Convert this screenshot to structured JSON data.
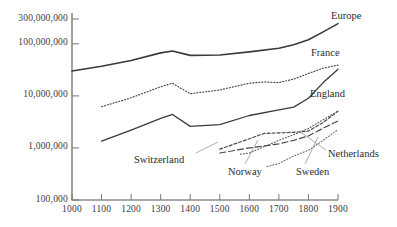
{
  "chart_data": {
    "type": "line",
    "title": "",
    "subtitle": "",
    "xlabel": "",
    "ylabel": "",
    "yscale": "log",
    "xlim": [
      1000,
      1900
    ],
    "ylim": [
      100000,
      300000000
    ],
    "grid": false,
    "legend_position": "inline-annotations",
    "y_ticks": [
      {
        "value": 300000000,
        "label": "300,000,000"
      },
      {
        "value": 100000000,
        "label": "100,000,000"
      },
      {
        "value": 10000000,
        "label": "10,000,000"
      },
      {
        "value": 1000000,
        "label": "1,000,000"
      },
      {
        "value": 100000,
        "label": "100,000"
      }
    ],
    "x_ticks": [
      {
        "value": 1000,
        "label": "1000"
      },
      {
        "value": 1100,
        "label": "1100"
      },
      {
        "value": 1200,
        "label": "1200"
      },
      {
        "value": 1300,
        "label": "1300"
      },
      {
        "value": 1400,
        "label": "1400"
      },
      {
        "value": 1500,
        "label": "1500"
      },
      {
        "value": 1600,
        "label": "1600"
      },
      {
        "value": 1700,
        "label": "1700"
      },
      {
        "value": 1800,
        "label": "1800"
      },
      {
        "value": 1900,
        "label": "1900"
      }
    ],
    "series": [
      {
        "name": "Europe",
        "style": "solid",
        "width": 1.6,
        "color": "#3a3a3a",
        "x": [
          1000,
          1100,
          1200,
          1300,
          1340,
          1400,
          1500,
          1600,
          1700,
          1750,
          1800,
          1850,
          1900
        ],
        "values": [
          30000000,
          37000000,
          48000000,
          67000000,
          73000000,
          60000000,
          61000000,
          70000000,
          82000000,
          96000000,
          120000000,
          170000000,
          245000000
        ]
      },
      {
        "name": "France",
        "style": "dotted",
        "width": 1.2,
        "color": "#4a4a4a",
        "x": [
          1100,
          1200,
          1300,
          1340,
          1400,
          1500,
          1600,
          1650,
          1700,
          1750,
          1800,
          1850,
          1900
        ],
        "values": [
          6200000,
          9200000,
          15000000,
          17500000,
          11000000,
          13000000,
          17500000,
          18500000,
          18000000,
          21000000,
          27000000,
          34000000,
          39000000
        ]
      },
      {
        "name": "England",
        "style": "solid",
        "width": 1.3,
        "color": "#3a3a3a",
        "x": [
          1100,
          1200,
          1300,
          1340,
          1400,
          1500,
          1600,
          1700,
          1750,
          1800,
          1850,
          1900
        ],
        "values": [
          1350000,
          2200000,
          3700000,
          4400000,
          2600000,
          2800000,
          4200000,
          5400000,
          6100000,
          9000000,
          18000000,
          32500000
        ]
      },
      {
        "name": "Netherlands",
        "style": "dashed",
        "width": 1.2,
        "color": "#4a4a4a",
        "x": [
          1500,
          1600,
          1650,
          1700,
          1750,
          1800,
          1850,
          1900
        ],
        "values": [
          950000,
          1500000,
          1900000,
          1950000,
          2000000,
          2100000,
          3100000,
          5100000
        ]
      },
      {
        "name": "Switzerland",
        "style": "long-dash",
        "width": 1.2,
        "color": "#4a4a4a",
        "x": [
          1500,
          1600,
          1700,
          1750,
          1800,
          1850,
          1900
        ],
        "values": [
          800000,
          1000000,
          1200000,
          1400000,
          1700000,
          2400000,
          3300000
        ]
      },
      {
        "name": "Sweden",
        "style": "dotted",
        "width": 1.1,
        "color": "#5a5a5a",
        "x": [
          1570,
          1600,
          1700,
          1750,
          1800,
          1850,
          1900
        ],
        "values": [
          760000,
          800000,
          1400000,
          1800000,
          2350000,
          3500000,
          5100000
        ]
      },
      {
        "name": "Norway",
        "style": "dotted",
        "width": 1.1,
        "color": "#6a6a6a",
        "x": [
          1660,
          1700,
          1750,
          1800,
          1850,
          1900
        ],
        "values": [
          440000,
          500000,
          700000,
          900000,
          1400000,
          2250000
        ]
      }
    ],
    "annotations": [
      {
        "name": "Europe",
        "text": "Europe",
        "x": 331,
        "y": 10,
        "leader": null
      },
      {
        "name": "France",
        "text": "France",
        "x": 311,
        "y": 47,
        "leader": null
      },
      {
        "name": "England",
        "text": "England",
        "x": 310,
        "y": 88,
        "leader": null
      },
      {
        "name": "Netherlands",
        "text": "Netherlands",
        "x": 328,
        "y": 148,
        "leader": {
          "x1": 326,
          "y1": 150,
          "x2": 299,
          "y2": 131
        }
      },
      {
        "name": "Sweden",
        "text": "Sweden",
        "x": 296,
        "y": 166,
        "leader": {
          "x1": 305,
          "y1": 164,
          "x2": 318,
          "y2": 137
        }
      },
      {
        "name": "Norway",
        "text": "Norway",
        "x": 228,
        "y": 166,
        "leader": {
          "x1": 245,
          "y1": 164,
          "x2": 258,
          "y2": 140
        }
      },
      {
        "name": "Switzerland",
        "text": "Switzerland",
        "x": 134,
        "y": 154,
        "leader": {
          "x1": 196,
          "y1": 153,
          "x2": 218,
          "y2": 142
        }
      }
    ]
  }
}
